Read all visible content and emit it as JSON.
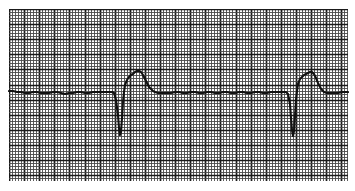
{
  "figure": {
    "kind": "ecg-rhythm-strip",
    "width": 355,
    "height": 191,
    "background_color": "#ffffff"
  },
  "grid": {
    "name": "ecg-graph-paper",
    "origin_x": 9,
    "origin_y": 9,
    "width": 339,
    "height": 172,
    "small_cell_px": 3.02,
    "large_cell_every": 5,
    "small_line_color": "#4a4a4a",
    "large_line_color": "#1a1a1a",
    "small_line_width": 0.9,
    "large_line_width": 1.7,
    "paper_color": "#ffffff"
  },
  "trace": {
    "name": "ecg-waveform",
    "color": "#111111",
    "line_width": 2.1,
    "baseline_y": 92,
    "description": "Sinus rhythm rhythm strip, two QRS complexes with deep S waves and broad T waves",
    "chart_data": {
      "type": "line",
      "title": "ECG Rhythm Strip",
      "xlabel": "",
      "ylabel": "",
      "xlim": [
        9,
        348
      ],
      "ylim": [
        181,
        9
      ],
      "grid": true,
      "legend": false,
      "series": [
        {
          "name": "lead-trace",
          "points": [
            [
              9,
              91
            ],
            [
              13,
              91
            ],
            [
              17,
              92
            ],
            [
              21,
              92
            ],
            [
              25,
              93
            ],
            [
              29,
              93
            ],
            [
              33,
              92
            ],
            [
              37,
              92
            ],
            [
              41,
              93
            ],
            [
              45,
              93
            ],
            [
              49,
              93
            ],
            [
              53,
              92
            ],
            [
              57,
              92
            ],
            [
              61,
              93
            ],
            [
              65,
              94
            ],
            [
              69,
              93
            ],
            [
              73,
              93
            ],
            [
              77,
              92
            ],
            [
              81,
              92
            ],
            [
              85,
              93
            ],
            [
              89,
              93
            ],
            [
              93,
              92
            ],
            [
              97,
              92
            ],
            [
              101,
              92
            ],
            [
              105,
              92
            ],
            [
              109,
              92
            ],
            [
              112,
              92
            ],
            [
              114,
              93
            ],
            [
              116,
              100
            ],
            [
              118,
              115
            ],
            [
              119,
              128
            ],
            [
              120,
              135
            ],
            [
              121,
              132
            ],
            [
              122,
              118
            ],
            [
              123,
              102
            ],
            [
              124,
              92
            ],
            [
              125,
              85
            ],
            [
              127,
              80
            ],
            [
              129,
              77
            ],
            [
              131,
              75
            ],
            [
              133,
              74
            ],
            [
              135,
              72
            ],
            [
              137,
              71
            ],
            [
              139,
              71
            ],
            [
              141,
              72
            ],
            [
              143,
              75
            ],
            [
              145,
              79
            ],
            [
              147,
              83
            ],
            [
              149,
              87
            ],
            [
              151,
              89
            ],
            [
              153,
              91
            ],
            [
              155,
              92
            ],
            [
              158,
              93
            ],
            [
              161,
              93
            ],
            [
              164,
              93
            ],
            [
              167,
              93
            ],
            [
              171,
              93
            ],
            [
              175,
              92
            ],
            [
              179,
              92
            ],
            [
              183,
              93
            ],
            [
              187,
              93
            ],
            [
              191,
              92
            ],
            [
              195,
              92
            ],
            [
              199,
              93
            ],
            [
              203,
              93
            ],
            [
              207,
              92
            ],
            [
              211,
              92
            ],
            [
              215,
              93
            ],
            [
              219,
              93
            ],
            [
              223,
              92
            ],
            [
              227,
              92
            ],
            [
              231,
              93
            ],
            [
              235,
              93
            ],
            [
              239,
              92
            ],
            [
              243,
              92
            ],
            [
              247,
              93
            ],
            [
              251,
              93
            ],
            [
              255,
              92
            ],
            [
              259,
              92
            ],
            [
              263,
              93
            ],
            [
              267,
              93
            ],
            [
              271,
              92
            ],
            [
              275,
              92
            ],
            [
              279,
              92
            ],
            [
              283,
              92
            ],
            [
              286,
              92
            ],
            [
              288,
              94
            ],
            [
              290,
              104
            ],
            [
              291,
              118
            ],
            [
              292,
              130
            ],
            [
              293,
              136
            ],
            [
              294,
              131
            ],
            [
              295,
              116
            ],
            [
              296,
              100
            ],
            [
              297,
              91
            ],
            [
              298,
              84
            ],
            [
              300,
              79
            ],
            [
              302,
              77
            ],
            [
              304,
              75
            ],
            [
              306,
              74
            ],
            [
              308,
              73
            ],
            [
              310,
              72
            ],
            [
              312,
              72
            ],
            [
              314,
              74
            ],
            [
              316,
              78
            ],
            [
              318,
              83
            ],
            [
              320,
              87
            ],
            [
              322,
              90
            ],
            [
              324,
              92
            ],
            [
              327,
              93
            ],
            [
              330,
              93
            ],
            [
              334,
              93
            ],
            [
              338,
              93
            ],
            [
              342,
              92
            ],
            [
              346,
              92
            ],
            [
              348,
              92
            ]
          ]
        }
      ]
    }
  }
}
